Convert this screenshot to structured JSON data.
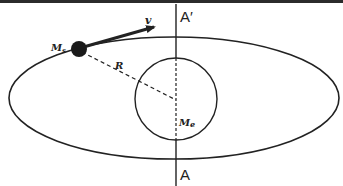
{
  "figure": {
    "colors": {
      "background": "#ffffff",
      "stroke": "#222222",
      "top_band": "#2b2b2b"
    },
    "labels": {
      "satellite_mass": "M",
      "satellite_mass_sub": "s",
      "velocity": "v",
      "radius": "R",
      "earth_mass": "M",
      "earth_mass_sub": "e",
      "axis_top": "A′",
      "axis_bottom": "A"
    }
  }
}
